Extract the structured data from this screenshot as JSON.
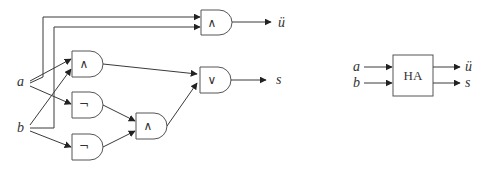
{
  "circuit": {
    "inputs": {
      "a": "a",
      "b": "b"
    },
    "outputs": {
      "carry": "ü",
      "sum": "s"
    },
    "gates": {
      "and_carry": "∧",
      "and_1": "∧",
      "not_1": "¬",
      "not_2": "¬",
      "and_2": "∧",
      "or_sum": "∨"
    }
  },
  "block": {
    "label": "HA",
    "inputs": {
      "a": "a",
      "b": "b"
    },
    "outputs": {
      "carry": "ü",
      "sum": "s"
    }
  }
}
